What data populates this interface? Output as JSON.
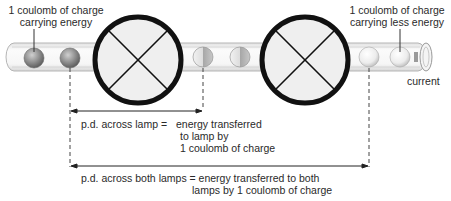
{
  "labels": {
    "charge_energy_line1": "1 coulomb of charge",
    "charge_energy_line2": "carrying energy",
    "charge_less_line1": "1 coulomb of charge",
    "charge_less_line2": "carrying less energy",
    "current": "current",
    "pd_lamp_lhs": "p.d. across lamp =",
    "pd_lamp_rhs_line1": "energy transferred",
    "pd_lamp_rhs_line2": "to lamp by",
    "pd_lamp_rhs_line3": "1 coulomb of charge",
    "pd_both_line1": "p.d. across both lamps = energy transferred to both",
    "pd_both_line2": "lamps by 1 coulomb of charge"
  },
  "components": {
    "lamps": [
      {
        "name": "lamp-1",
        "cx": 138,
        "cy": 60,
        "r": 43
      },
      {
        "name": "lamp-2",
        "cx": 305,
        "cy": 60,
        "r": 43
      }
    ],
    "charges": [
      {
        "cx": 34,
        "energy": "full"
      },
      {
        "cx": 70,
        "energy": "full"
      },
      {
        "cx": 203,
        "energy": "half"
      },
      {
        "cx": 240,
        "energy": "half"
      },
      {
        "cx": 369,
        "energy": "low"
      },
      {
        "cx": 400,
        "energy": "low"
      }
    ]
  },
  "colors": {
    "lamp_stroke": "#111111",
    "lamp_fill": "#eeeeee",
    "wire_fill": "#f6f6f6",
    "wire_stroke": "#b8b8b8",
    "charge_full": "#8a8a8a",
    "charge_half": "#c2c2c2",
    "charge_low": "#ececec"
  }
}
